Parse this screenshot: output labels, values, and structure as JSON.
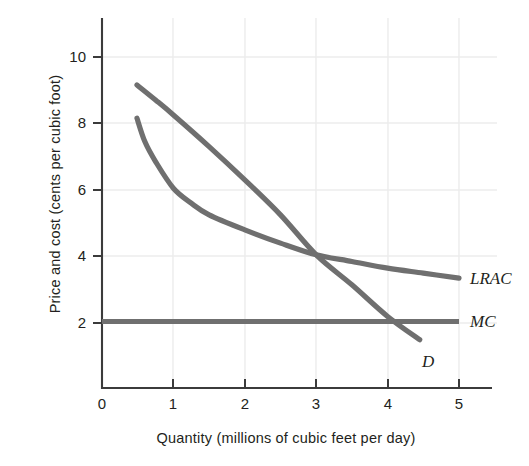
{
  "chart_data": {
    "type": "line",
    "title": "",
    "xlabel": "Quantity (millions of cubic feet per day)",
    "ylabel": "Price and cost (cents per cubic foot)",
    "xlim": [
      0,
      5.35
    ],
    "ylim": [
      0,
      11.2
    ],
    "xticks": [
      "0",
      "1",
      "2",
      "3",
      "4",
      "5"
    ],
    "xtick_values": [
      0,
      1,
      2,
      3,
      4,
      5
    ],
    "yticks": [
      "2",
      "4",
      "6",
      "8",
      "10"
    ],
    "ytick_values": [
      2,
      4,
      6,
      8,
      10
    ],
    "grid": true,
    "grid_color": "#e9e9e9",
    "legend_position": "right-of-curve-ends",
    "line_color": "#6f6f6f",
    "line_width": 5,
    "axis_color": "#3b3b3b",
    "series": [
      {
        "name": "D",
        "label": "D",
        "label_x": 4.5,
        "label_y": 1.0,
        "x": [
          0.49,
          0.75,
          1.0,
          1.5,
          2.0,
          2.5,
          3.0,
          3.5,
          4.0,
          4.45
        ],
        "y": [
          9.1,
          8.65,
          8.2,
          7.25,
          6.25,
          5.2,
          4.0,
          3.1,
          2.15,
          1.45
        ]
      },
      {
        "name": "LRAC",
        "label": "LRAC",
        "label_x": 5.15,
        "label_y": 3.35,
        "x": [
          0.49,
          0.6,
          0.75,
          1.0,
          1.25,
          1.5,
          2.0,
          2.5,
          3.0,
          3.5,
          4.0,
          4.5,
          5.0
        ],
        "y": [
          8.1,
          7.4,
          6.8,
          6.0,
          5.55,
          5.2,
          4.75,
          4.35,
          4.0,
          3.8,
          3.6,
          3.45,
          3.3
        ]
      },
      {
        "name": "MC",
        "label": "MC",
        "label_x": 5.15,
        "label_y": 2.0,
        "x": [
          0.0,
          5.0
        ],
        "y": [
          2.0,
          2.0
        ]
      }
    ],
    "annotations": [
      {
        "text": "LRAC",
        "meaning": "long-run average cost curve"
      },
      {
        "text": "MC",
        "meaning": "marginal cost curve"
      },
      {
        "text": "D",
        "meaning": "demand curve"
      }
    ]
  }
}
